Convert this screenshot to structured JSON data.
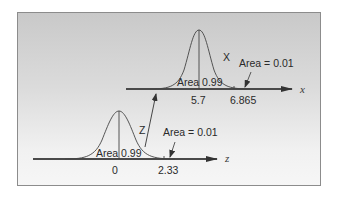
{
  "diagram": {
    "upper": {
      "variable_label": "X",
      "axis_label": "x",
      "mean_tick": "5.7",
      "cutoff_tick": "6.865",
      "central_area_label": "Area 0.99",
      "tail_area_label": "Area = 0.01"
    },
    "lower": {
      "variable_label": "Z",
      "axis_label": "z",
      "mean_tick": "0",
      "cutoff_tick": "2.33",
      "central_area_label": "Area 0.99",
      "tail_area_label": "Area = 0.01"
    },
    "colors": {
      "line": "#3a3a3a",
      "axis": "#4a4a4a",
      "frame_border": "#8c8c8c"
    }
  }
}
